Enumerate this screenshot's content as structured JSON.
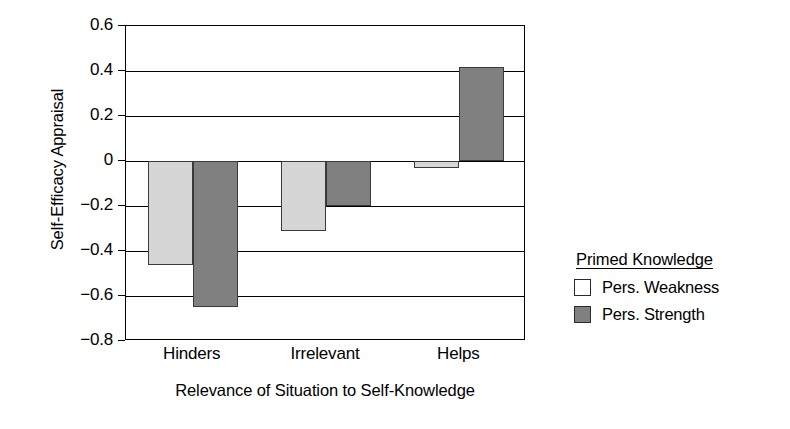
{
  "chart_data": {
    "type": "bar",
    "title": "",
    "xlabel": "Relevance of Situation to Self-Knowledge",
    "ylabel": "Self-Efficacy Appraisal",
    "categories": [
      "Hinders",
      "Irrelevant",
      "Helps"
    ],
    "series": [
      {
        "name": "Pers. Weakness",
        "values": [
          -0.46,
          -0.31,
          -0.03
        ],
        "color": "#d6d6d6"
      },
      {
        "name": "Pers. Strength",
        "values": [
          -0.65,
          -0.2,
          0.42
        ],
        "color": "#808080"
      }
    ],
    "ylim": [
      -0.8,
      0.6
    ],
    "yticks": [
      0.6,
      0.4,
      0.2,
      0,
      -0.2,
      -0.4,
      -0.6,
      -0.8
    ],
    "ytick_labels": [
      "0.6",
      "0.4",
      "0.2",
      "0",
      "−0.2",
      "−0.4",
      "−0.6",
      "−0.8"
    ],
    "grid": true,
    "legend_position": "right",
    "legend_title": "Primed Knowledge"
  },
  "legend": {
    "title": "Primed Knowledge",
    "entries": [
      {
        "label": "Pers. Weakness",
        "swatch": "weakness"
      },
      {
        "label": "Pers. Strength",
        "swatch": "strength"
      }
    ]
  }
}
